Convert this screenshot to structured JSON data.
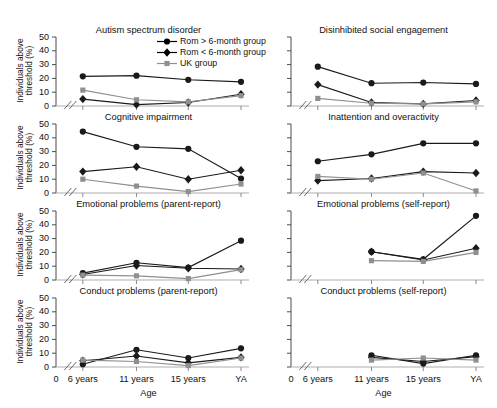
{
  "figure": {
    "axis_labels": {
      "y_title": "Individuals above threshold (%)",
      "x_title": "Age"
    },
    "y_ticks": [
      "0",
      "10",
      "20",
      "30",
      "40",
      "50"
    ],
    "x_ticks": [
      "0",
      "6 years",
      "11 years",
      "15 years",
      "YA"
    ]
  },
  "legend": {
    "items": [
      {
        "label": "Rom > 6-month group",
        "marker": "circle",
        "color": "#000000"
      },
      {
        "label": "Rom < 6-month group",
        "marker": "diamond",
        "color": "#000000"
      },
      {
        "label": "UK group",
        "marker": "square",
        "color": "#909090"
      }
    ]
  },
  "chart_data": [
    {
      "type": "line",
      "title": "Autism spectrum disorder",
      "xlabel": "Age",
      "ylabel": "Individuals above threshold (%)",
      "categories": [
        "6 years",
        "11 years",
        "15 years",
        "YA"
      ],
      "ylim": [
        0,
        50
      ],
      "grid": false,
      "legend_position": "top-right",
      "series": [
        {
          "name": "Rom > 6-month group",
          "values": [
            21.5,
            22.0,
            19.0,
            17.5
          ]
        },
        {
          "name": "Rom < 6-month group",
          "values": [
            5.0,
            1.0,
            2.5,
            8.5
          ]
        },
        {
          "name": "UK group",
          "values": [
            11.5,
            4.5,
            3.0,
            7.5
          ]
        }
      ]
    },
    {
      "type": "line",
      "title": "Disinhibited social engagement",
      "xlabel": "Age",
      "ylabel": "Individuals above threshold (%)",
      "categories": [
        "6 years",
        "11 years",
        "15 years",
        "YA"
      ],
      "ylim": [
        0,
        50
      ],
      "grid": false,
      "series": [
        {
          "name": "Rom > 6-month group",
          "values": [
            28.5,
            16.5,
            17.0,
            16.0
          ]
        },
        {
          "name": "Rom < 6-month group",
          "values": [
            15.5,
            2.5,
            1.5,
            4.0
          ]
        },
        {
          "name": "UK group",
          "values": [
            5.5,
            2.0,
            1.5,
            3.0
          ]
        }
      ]
    },
    {
      "type": "line",
      "title": "Cognitive impairment",
      "xlabel": "Age",
      "ylabel": "Individuals above threshold (%)",
      "categories": [
        "6 years",
        "11 years",
        "15 years",
        "YA"
      ],
      "ylim": [
        0,
        50
      ],
      "grid": false,
      "series": [
        {
          "name": "Rom > 6-month group",
          "values": [
            44.5,
            33.5,
            32.0,
            10.5
          ]
        },
        {
          "name": "Rom < 6-month group",
          "values": [
            15.5,
            19.0,
            10.0,
            16.5
          ]
        },
        {
          "name": "UK group",
          "values": [
            10.0,
            5.0,
            1.0,
            6.5
          ]
        }
      ]
    },
    {
      "type": "line",
      "title": "Inattention and overactivity",
      "xlabel": "Age",
      "ylabel": "Individuals above threshold (%)",
      "categories": [
        "6 years",
        "11 years",
        "15 years",
        "YA"
      ],
      "ylim": [
        0,
        50
      ],
      "grid": false,
      "series": [
        {
          "name": "Rom > 6-month group",
          "values": [
            23.0,
            28.0,
            36.0,
            36.0
          ]
        },
        {
          "name": "Rom < 6-month group",
          "values": [
            9.0,
            10.5,
            15.5,
            14.5
          ]
        },
        {
          "name": "UK group",
          "values": [
            12.0,
            10.0,
            14.5,
            1.5
          ]
        }
      ]
    },
    {
      "type": "line",
      "title": "Emotional problems (parent-report)",
      "xlabel": "Age",
      "ylabel": "Individuals above threshold (%)",
      "categories": [
        "6 years",
        "11 years",
        "15 years",
        "YA"
      ],
      "ylim": [
        0,
        50
      ],
      "grid": false,
      "series": [
        {
          "name": "Rom > 6-month group",
          "values": [
            5.0,
            12.5,
            9.0,
            28.5
          ]
        },
        {
          "name": "Rom < 6-month group",
          "values": [
            4.0,
            10.5,
            8.5,
            8.0
          ]
        },
        {
          "name": "UK group",
          "values": [
            3.5,
            3.0,
            1.0,
            7.5
          ]
        }
      ]
    },
    {
      "type": "line",
      "title": "Emotional problems (self-report)",
      "xlabel": "Age",
      "ylabel": "Individuals above threshold (%)",
      "categories": [
        "11 years",
        "15 years",
        "YA"
      ],
      "ylim": [
        0,
        50
      ],
      "grid": false,
      "series": [
        {
          "name": "Rom > 6-month group",
          "values": [
            20.5,
            15.0,
            46.5
          ]
        },
        {
          "name": "Rom < 6-month group",
          "values": [
            20.5,
            14.5,
            23.0
          ]
        },
        {
          "name": "UK group",
          "values": [
            14.0,
            13.5,
            20.0
          ]
        }
      ]
    },
    {
      "type": "line",
      "title": "Conduct problems (parent-report)",
      "xlabel": "Age",
      "ylabel": "Individuals above threshold (%)",
      "categories": [
        "6 years",
        "11 years",
        "15 years",
        "YA"
      ],
      "ylim": [
        0,
        50
      ],
      "grid": false,
      "series": [
        {
          "name": "Rom > 6-month group",
          "values": [
            2.0,
            12.5,
            6.5,
            13.5
          ]
        },
        {
          "name": "Rom < 6-month group",
          "values": [
            4.5,
            8.0,
            3.0,
            7.0
          ]
        },
        {
          "name": "UK group",
          "values": [
            5.0,
            4.0,
            1.0,
            6.5
          ]
        }
      ]
    },
    {
      "type": "line",
      "title": "Conduct problems (self-report)",
      "xlabel": "Age",
      "ylabel": "Individuals above threshold (%)",
      "categories": [
        "11 years",
        "15 years",
        "YA"
      ],
      "ylim": [
        0,
        50
      ],
      "grid": false,
      "series": [
        {
          "name": "Rom > 6-month group",
          "values": [
            8.5,
            2.5,
            8.5
          ]
        },
        {
          "name": "Rom < 6-month group",
          "values": [
            7.0,
            4.0,
            7.5
          ]
        },
        {
          "name": "UK group",
          "values": [
            5.0,
            6.5,
            5.0
          ]
        }
      ]
    }
  ]
}
